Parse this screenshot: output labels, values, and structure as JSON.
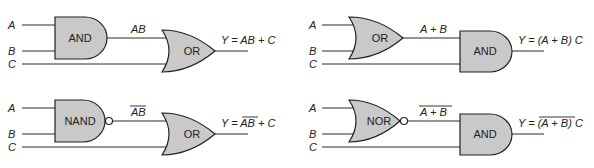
{
  "circuits": [
    {
      "id": "and-or",
      "inputs": [
        "A",
        "B",
        "C"
      ],
      "gate1": "AND",
      "gate2": "OR",
      "intermediate": "AB",
      "intermediate_overline": false,
      "output_prefix": "Y = ",
      "output_expr": "AB + C"
    },
    {
      "id": "or-and",
      "inputs": [
        "A",
        "B",
        "C"
      ],
      "gate1": "OR",
      "gate2": "AND",
      "intermediate": "A + B",
      "intermediate_overline": false,
      "output_prefix": "Y = ",
      "output_expr": "(A + B) C"
    },
    {
      "id": "nand-or",
      "inputs": [
        "A",
        "B",
        "C"
      ],
      "gate1": "NAND",
      "gate2": "OR",
      "intermediate": "AB",
      "intermediate_overline": true,
      "output_prefix": "Y = ",
      "output_overline": "AB",
      "output_rest": " + C"
    },
    {
      "id": "nor-and",
      "inputs": [
        "A",
        "B",
        "C"
      ],
      "gate1": "NOR",
      "gate2": "AND",
      "intermediate": "A + B",
      "intermediate_overline": true,
      "output_prefix": "Y = ",
      "output_overline": "(A + B)",
      "output_rest": " C"
    }
  ],
  "colors": {
    "gate_fill": "#c9c9c9",
    "line": "#222222"
  }
}
